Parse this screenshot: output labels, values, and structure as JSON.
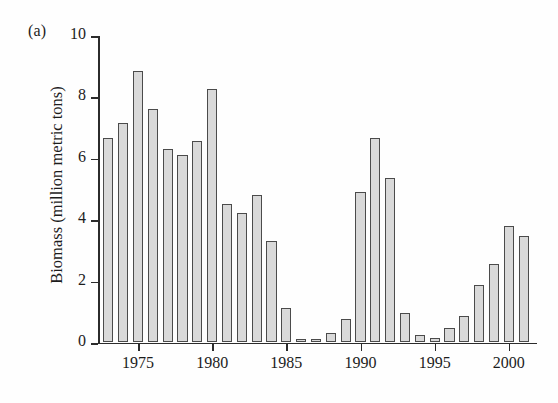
{
  "figure": {
    "panel_label": "(a)",
    "y_axis_title": "Biomass (million metric tons)"
  },
  "chart_data": {
    "type": "bar",
    "title": "",
    "xlabel": "",
    "ylabel": "Biomass (million metric tons)",
    "ylim": [
      0,
      10
    ],
    "xlim": [
      1972.3,
      2001.9
    ],
    "grid": false,
    "legend": null,
    "y_ticks": [
      0,
      2,
      4,
      6,
      8,
      10
    ],
    "y_tick_labels": [
      "0",
      "2",
      "4",
      "6",
      "8",
      "10"
    ],
    "x_ticks": [
      1975,
      1980,
      1985,
      1990,
      1995,
      2000
    ],
    "x_tick_labels": [
      "1975",
      "1980",
      "1985",
      "1990",
      "1995",
      "2000"
    ],
    "bar_fill_color": "#d9d9d9",
    "bar_edge_color": "#4b4b4b",
    "categories": [
      1973,
      1974,
      1975,
      1976,
      1977,
      1978,
      1979,
      1980,
      1981,
      1982,
      1983,
      1984,
      1985,
      1986,
      1987,
      1988,
      1989,
      1990,
      1991,
      1992,
      1993,
      1994,
      1995,
      1996,
      1997,
      1998,
      1999,
      2000,
      2001
    ],
    "values": [
      6.65,
      7.15,
      8.85,
      7.6,
      6.3,
      6.1,
      6.55,
      8.25,
      4.5,
      4.2,
      4.8,
      3.3,
      1.1,
      0.12,
      0.1,
      0.3,
      0.75,
      4.9,
      6.65,
      5.35,
      0.95,
      0.22,
      0.15,
      0.45,
      0.85,
      1.85,
      2.55,
      3.8,
      3.45
    ]
  }
}
